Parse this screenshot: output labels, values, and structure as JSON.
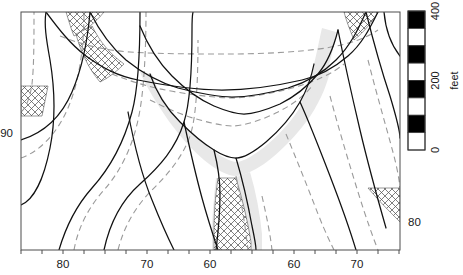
{
  "figure": {
    "kind": "contour-map",
    "background": "#ffffff",
    "frame": {
      "x": 21,
      "y": 12,
      "width": 379,
      "height": 238,
      "stroke": "#4d4d4d"
    }
  },
  "axes": {
    "x": {
      "name": "longitude-axis",
      "ticks": [
        {
          "label": "",
          "x": 21
        },
        {
          "label": "",
          "x": 42
        },
        {
          "label": "80",
          "x": 63
        },
        {
          "label": "",
          "x": 84
        },
        {
          "label": "",
          "x": 105
        },
        {
          "label": "",
          "x": 126
        },
        {
          "label": "70",
          "x": 147
        },
        {
          "label": "",
          "x": 168
        },
        {
          "label": "",
          "x": 189
        },
        {
          "label": "60",
          "x": 210
        },
        {
          "label": "",
          "x": 231
        },
        {
          "label": "",
          "x": 252
        },
        {
          "label": "",
          "x": 273
        },
        {
          "label": "60",
          "x": 294
        },
        {
          "label": "",
          "x": 315
        },
        {
          "label": "",
          "x": 336
        },
        {
          "label": "70",
          "x": 357
        },
        {
          "label": "",
          "x": 378
        },
        {
          "label": "",
          "x": 399
        }
      ]
    },
    "y": {
      "name": "latitude-axis",
      "left_ticks": [
        {
          "label": "90",
          "y": 133
        }
      ],
      "right_ticks": [
        {
          "label": "80",
          "y": 222
        }
      ]
    }
  },
  "colorbar": {
    "name": "scale-bar",
    "title": "feet",
    "orientation": "vertical",
    "x": 408,
    "y": 11,
    "width": 17,
    "height": 139,
    "segment_count": 8,
    "colors": [
      "#000000",
      "#ffffff",
      "#000000",
      "#ffffff",
      "#000000",
      "#ffffff",
      "#000000",
      "#ffffff"
    ],
    "ticks": [
      {
        "label": "400",
        "value": 400,
        "y": 11
      },
      {
        "label": "200",
        "value": 200,
        "y": 80.5
      },
      {
        "label": "0",
        "value": 0,
        "y": 150
      }
    ],
    "range": [
      0,
      400
    ],
    "units": "feet"
  },
  "chart_data": {
    "type": "contour",
    "title": "",
    "xlabel": "",
    "ylabel": "",
    "legend": "feet",
    "contour_interval_feet": 50,
    "contour_levels_feet": [
      0,
      50,
      100,
      150,
      200,
      250,
      300,
      350,
      400
    ],
    "solid_contours": [
      "M21,205 C34,200 44,178 50,148 C56,118 54,84 50,60 C46,38 44,24 46,12",
      "M21,140 C40,134 60,120 72,92 C84,64 88,36 90,12",
      "M59,250 C66,226 76,206 92,188 C110,168 124,142 132,112 C139,86 140,46 140,12",
      "M104,250 C110,222 122,200 140,184 C160,166 176,148 184,122 C191,100 192,56 192,30 C192,20 192,16 193,12",
      "M46,12 C58,28 70,44 86,56 C104,69 118,76 138,80 C168,86 196,90 222,90 C248,90 276,86 302,80 C320,76 334,68 348,56 C362,44 370,28 378,12",
      "M90,12 C100,32 112,48 126,60 C142,73 158,82 178,88 C200,94 222,97 232,97 C244,97 266,94 288,88 C308,82 322,74 336,60 C350,46 358,30 366,12",
      "M140,26 C148,46 158,62 172,76 C186,90 200,100 214,106 C226,111 238,114 244,114 C252,114 266,110 280,104 C296,96 308,86 318,74 C328,62 334,46 338,30",
      "M150,74 C156,92 166,108 180,122 C192,134 204,144 214,150 C222,155 230,158 236,158 C244,158 254,152 266,142 C280,130 292,116 300,102 C308,88 312,74 314,64",
      "M128,112 C134,144 142,176 152,200 C160,220 168,238 174,250",
      "M184,122 C190,150 196,176 202,198 C208,220 214,238 218,250",
      "M236,158 C242,178 248,204 252,226 C255,240 256,246 256,250",
      "M214,150 C218,166 220,180 220,194 C220,214 218,234 216,250",
      "M300,102 C310,124 320,150 330,176 C340,202 350,230 356,250",
      "M338,30 C344,60 352,96 360,130 C368,164 378,200 386,228",
      "M366,12 C372,36 380,66 390,96 C396,116 400,130 400,138",
      "M400,56 C392,46 386,34 384,12"
    ],
    "dashed_contours": [
      "M21,158 C38,152 56,136 68,108 C80,80 84,44 84,12",
      "M21,112 C26,108 30,98 32,84 C34,66 34,40 34,12",
      "M74,250 C78,228 88,208 104,190 C120,172 132,148 138,120 C144,94 146,50 146,12",
      "M118,250 C124,226 136,206 152,190 C168,174 182,158 190,136 C197,116 198,72 198,40",
      "M60,36 C80,44 102,50 130,52 C160,54 196,54 228,54 C262,54 300,52 326,48 C350,44 366,38 378,30",
      "M112,74 C132,82 152,88 176,92 C200,96 222,98 232,98 C246,98 270,94 292,88 C314,82 332,74 344,64",
      "M150,100 C166,108 184,116 200,120 C214,124 226,126 232,126 C244,126 262,120 278,112 C294,104 306,94 312,86",
      "M236,176 C240,196 244,218 246,234 C247,243 248,248 248,250",
      "M286,134 C296,158 308,188 318,214 C326,234 332,246 334,250",
      "M330,96 C338,126 348,160 358,192 C366,218 374,240 378,250",
      "M368,60 C376,92 386,126 394,156 C399,176 400,186 400,192",
      "M262,196 C266,214 270,232 272,250"
    ],
    "shaded_bands": [
      {
        "fill": "#e8e8e8",
        "path": "M152,74 C158,92 168,110 182,124 C196,138 208,148 218,154 C224,158 232,162 236,162 C244,162 256,154 268,144 C282,132 294,118 302,104 C310,90 314,76 316,66 L330,72 C326,88 318,106 306,122 C294,138 278,154 264,164 C252,172 242,176 236,176 C228,176 216,170 204,160 C190,148 176,132 164,114 C152,96 144,82 140,72 Z"
      },
      {
        "fill": "#e8e8e8",
        "path": "M228,180 C234,200 240,226 243,244 L243,250 L262,250 L262,234 C260,214 256,192 250,172 Z"
      },
      {
        "fill": "#e8e8e8",
        "path": "M216,178 C214,196 212,216 212,234 L212,250 L230,250 L230,232 C230,214 232,196 234,180 Z"
      },
      {
        "fill": "#e8e8e8",
        "path": "M300,102 C308,88 312,74 314,64 C318,48 320,36 322,28 L336,32 C334,46 330,64 324,80 C318,96 310,112 302,124 Z"
      }
    ],
    "hatched_regions": [
      {
        "name": "upper-left-corner",
        "path": "M66,12 L104,12 C96,22 86,30 74,36 C70,26 68,18 66,12 Z"
      },
      {
        "name": "upper-left-band",
        "path": "M92,26 C100,42 110,54 124,64 C116,72 108,78 100,82 C88,68 80,50 76,34 Z"
      },
      {
        "name": "left-edge",
        "path": "M21,86 L48,86 C46,96 44,106 42,116 L21,116 Z"
      },
      {
        "name": "upper-right-corner",
        "path": "M344,12 L378,12 C372,22 364,32 354,40 C350,30 346,20 344,12 Z"
      },
      {
        "name": "lower-right-corner",
        "path": "M368,188 L400,188 L400,222 C390,212 378,200 368,188 Z"
      },
      {
        "name": "center-channel",
        "path": "M236,178 C242,198 248,222 251,242 L251,250 L214,250 L214,230 C214,210 216,192 218,178 Z"
      }
    ],
    "axis_x_ticklabels": [
      "80",
      "70",
      "60",
      "60",
      "70"
    ],
    "axis_y_ticklabels_left": [
      "90"
    ],
    "axis_y_ticklabels_right": [
      "80"
    ],
    "colorbar_ticklabels": [
      "400",
      "200",
      "0"
    ],
    "colorbar_title": "feet"
  }
}
